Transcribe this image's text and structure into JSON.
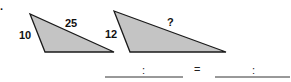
{
  "problem": {
    "bullet": ".",
    "triangle_left": {
      "side_left": "10",
      "side_top": "25",
      "fill": "#c4c4c4",
      "stroke": "#1a1a1a"
    },
    "triangle_right": {
      "side_left": "12",
      "side_top": "?",
      "fill": "#c4c4c4",
      "stroke": "#1a1a1a"
    },
    "proportion": {
      "ratio_separator": ":",
      "equals": "="
    }
  }
}
